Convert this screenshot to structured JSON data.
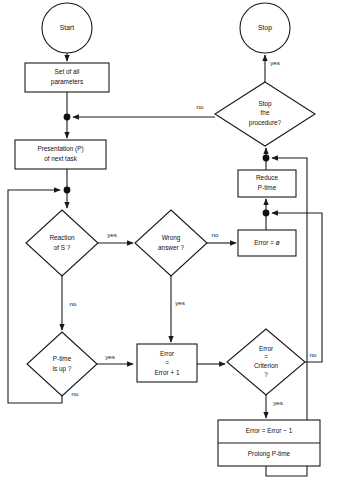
{
  "diagram": {
    "type": "flowchart",
    "background_color": "#ffffff",
    "line_color": "#1a1a1a",
    "text_color": "#111111",
    "nodes": [
      {
        "id": "start",
        "shape": "terminator-circle",
        "lines": [
          "Start"
        ],
        "cx": 67,
        "cy": 28,
        "rx": 25,
        "ry": 25
      },
      {
        "id": "stop",
        "shape": "terminator-circle",
        "lines": [
          "Stop"
        ],
        "cx": 265,
        "cy": 28,
        "rx": 25,
        "ry": 25
      },
      {
        "id": "set-params",
        "shape": "process-box",
        "lines": [
          "Set of all",
          "parameters"
        ],
        "x": 25,
        "y": 63,
        "w": 84,
        "h": 29
      },
      {
        "id": "presentation",
        "shape": "process-box",
        "lines": [
          "Presentation (P)",
          "of next task"
        ],
        "x": 15,
        "y": 140,
        "w": 91,
        "h": 29
      },
      {
        "id": "stop-proc",
        "shape": "decision-diamond",
        "lines": [
          "Stop",
          "the",
          "procedure?"
        ],
        "cx": 265,
        "cy": 114,
        "rx": 50,
        "ry": 32
      },
      {
        "id": "reduce-ptime",
        "shape": "process-box",
        "lines": [
          "Reduce",
          "P-time"
        ],
        "x": 238,
        "y": 170,
        "w": 58,
        "h": 27
      },
      {
        "id": "reaction",
        "shape": "decision-diamond",
        "lines": [
          "Reaction",
          "of S ?"
        ],
        "cx": 62,
        "cy": 243,
        "rx": 36,
        "ry": 33
      },
      {
        "id": "wrong-answer",
        "shape": "decision-diamond",
        "lines": [
          "Wrong",
          "answer ?"
        ],
        "cx": 171,
        "cy": 243,
        "rx": 36,
        "ry": 33
      },
      {
        "id": "error-zero",
        "shape": "process-box",
        "lines": [
          "Error = ø"
        ],
        "x": 238,
        "y": 230,
        "w": 58,
        "h": 26
      },
      {
        "id": "ptime-up",
        "shape": "decision-diamond",
        "lines": [
          "P-time",
          "is up ?"
        ],
        "cx": 62,
        "cy": 364,
        "rx": 35,
        "ry": 32
      },
      {
        "id": "error-inc",
        "shape": "process-box",
        "lines": [
          "Error",
          "=",
          "Error + 1"
        ],
        "x": 137,
        "y": 344,
        "w": 60,
        "h": 38
      },
      {
        "id": "error-crit",
        "shape": "decision-diamond",
        "lines": [
          "Error",
          "=",
          "Criterion",
          "?"
        ],
        "cx": 266,
        "cy": 362,
        "rx": 39,
        "ry": 33
      },
      {
        "id": "error-dec",
        "shape": "stacked-box",
        "lines": [
          "Error = Error − 1",
          "Prolong P-time"
        ],
        "x": 218,
        "y": 420,
        "w": 102,
        "h": 46
      }
    ],
    "edge_labels": [
      {
        "id": "lbl-stop-yes",
        "text": "yes",
        "x": 275,
        "y": 63
      },
      {
        "id": "lbl-stop-no",
        "text": "no",
        "x": 200,
        "y": 107
      },
      {
        "id": "lbl-reaction-yes",
        "text": "yes",
        "x": 112,
        "y": 235
      },
      {
        "id": "lbl-reaction-no",
        "text": "no",
        "x": 73,
        "y": 304
      },
      {
        "id": "lbl-wrong-no",
        "text": "no",
        "x": 215,
        "y": 235
      },
      {
        "id": "lbl-wrong-yes",
        "text": "yes",
        "x": 180,
        "y": 303
      },
      {
        "id": "lbl-ptime-yes",
        "text": "yes",
        "x": 110,
        "y": 357
      },
      {
        "id": "lbl-ptime-no",
        "text": "no",
        "x": 75,
        "y": 394
      },
      {
        "id": "lbl-crit-no",
        "text": "no",
        "x": 313,
        "y": 355
      },
      {
        "id": "lbl-crit-yes",
        "text": "yes",
        "x": 278,
        "y": 403
      }
    ],
    "junctions": [
      {
        "id": "junction-after-params",
        "cx": 67,
        "cy": 117
      },
      {
        "id": "junction-after-pres",
        "cx": 67,
        "cy": 190
      },
      {
        "id": "junction-above-reduce",
        "cx": 266,
        "cy": 158
      },
      {
        "id": "junction-above-error0",
        "cx": 266,
        "cy": 213
      }
    ]
  }
}
